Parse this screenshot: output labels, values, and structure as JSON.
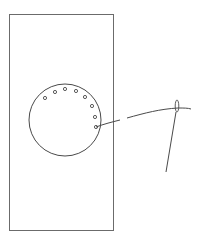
{
  "diagram": {
    "title": "",
    "colors": {
      "background": "#ffffff",
      "stroke": "#4a4a4a",
      "fabric_edge": "#6b6b6b"
    },
    "fabric": {
      "x": 9,
      "y": 14,
      "width": 104,
      "height": 216
    },
    "circle": {
      "cx": 65,
      "cy": 120,
      "r": 36
    },
    "holes": [
      {
        "cx": 45,
        "cy": 98
      },
      {
        "cx": 55,
        "cy": 92
      },
      {
        "cx": 65,
        "cy": 89
      },
      {
        "cx": 76,
        "cy": 91
      },
      {
        "cx": 85,
        "cy": 97
      },
      {
        "cx": 92,
        "cy": 106
      },
      {
        "cx": 95,
        "cy": 117
      },
      {
        "cx": 96,
        "cy": 127
      }
    ],
    "thread": {
      "segments": [
        "M96,127 C104,124 112,122 120,120",
        "M127,118 C145,113 160,109 178,108 C184,108 188,108 191,109"
      ]
    },
    "needle": {
      "eye": {
        "cx": 177,
        "cy": 106,
        "rx": 1.8,
        "ry": 6
      },
      "shaft": "M176,112 L166,172"
    }
  }
}
